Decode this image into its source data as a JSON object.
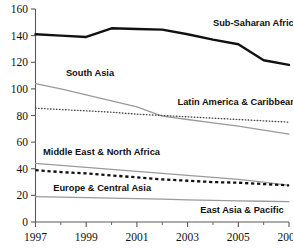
{
  "chart_data": {
    "type": "line",
    "title": "",
    "xlabel": "",
    "ylabel": "",
    "x": [
      1997,
      1998,
      1999,
      2000,
      2001,
      2002,
      2003,
      2004,
      2005,
      2006,
      2007
    ],
    "xlim": [
      1997,
      2007
    ],
    "ylim": [
      0,
      160
    ],
    "xticks": [
      1997,
      1999,
      2001,
      2003,
      2005,
      2007
    ],
    "xtick_labels": [
      "1997",
      "1999",
      "2001",
      "2003",
      "2005",
      "2007"
    ],
    "xminor_ticks": [
      1998,
      2000,
      2002,
      2004,
      2006
    ],
    "yticks": [
      0,
      20,
      40,
      60,
      80,
      100,
      120,
      140,
      160
    ],
    "ytick_labels": [
      "0",
      "20",
      "40",
      "60",
      "80",
      "100",
      "120",
      "140",
      "160"
    ],
    "grid": false,
    "legend": "inline-labels",
    "series": [
      {
        "name": "Sub-Saharan Africa",
        "style": "solid-thick",
        "color": "#111111",
        "width": 2.4,
        "values": [
          141,
          140,
          139,
          145.5,
          145,
          144.5,
          141,
          137,
          133.5,
          121.5,
          118
        ],
        "label_x": 2004.0,
        "label_y": 147
      },
      {
        "name": "South Asia",
        "style": "solid-thin",
        "color": "#9a9a9a",
        "width": 1.3,
        "values": [
          104,
          100,
          95.5,
          91,
          86.5,
          79.5,
          77,
          74.5,
          72,
          69,
          66
        ],
        "label_x": 1998.2,
        "label_y": 110
      },
      {
        "name": "Latin America & Caribbean",
        "style": "dotted-thin",
        "color": "#4a4a4a",
        "width": 1.35,
        "values": [
          85.5,
          84.5,
          83.5,
          82.5,
          81,
          80,
          79,
          78,
          77,
          76,
          75
        ],
        "label_x": 2002.6,
        "label_y": 88
      },
      {
        "name": "Middle East & North Africa",
        "style": "solid-thin",
        "color": "#9a9a9a",
        "width": 1.3,
        "values": [
          44,
          42.5,
          41,
          39.5,
          38,
          36.5,
          35,
          33.5,
          32,
          30,
          27.5
        ],
        "label_x": 1997.3,
        "label_y": 50
      },
      {
        "name": "Europe & Central Asia",
        "style": "dashed-thick",
        "color": "#111111",
        "width": 2.3,
        "values": [
          39,
          37.5,
          36.5,
          35,
          33.5,
          32,
          31,
          30,
          29.5,
          28.5,
          27.5
        ],
        "label_x": 1997.7,
        "label_y": 23.5
      },
      {
        "name": "East Asia & Pacific",
        "style": "solid-thin",
        "color": "#9a9a9a",
        "width": 1.3,
        "values": [
          19,
          18.7,
          18.3,
          18,
          17.6,
          17.2,
          16.6,
          16.2,
          15.9,
          15.6,
          15.3
        ],
        "label_x": 2003.5,
        "label_y": 6.5
      }
    ]
  },
  "axis": {
    "y_axis_name": "y-axis",
    "x_axis_name": "x-axis"
  },
  "top_clipped_text": ""
}
